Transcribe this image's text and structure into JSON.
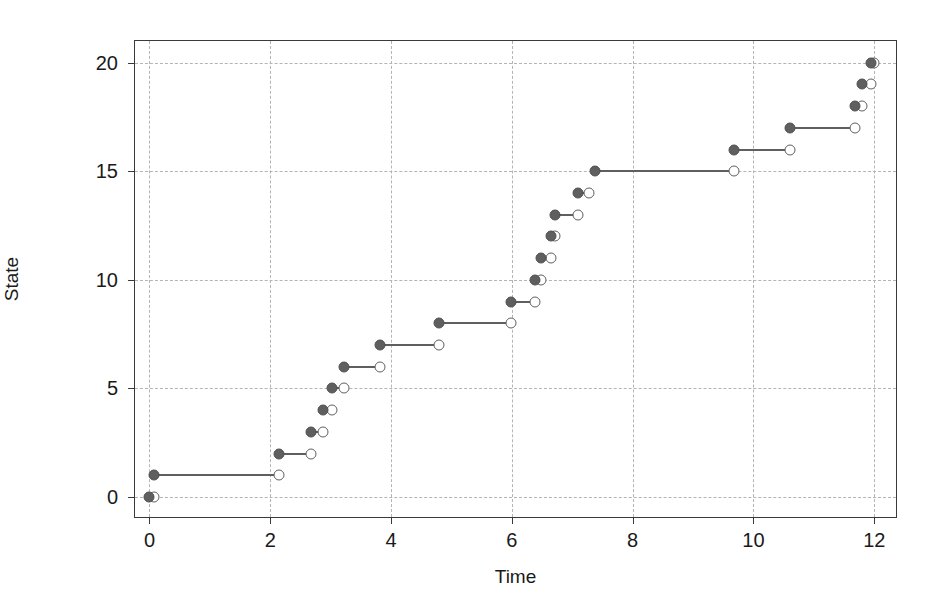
{
  "chart_data": {
    "type": "line",
    "title": "",
    "xlabel": "Time",
    "ylabel": "State",
    "xlim": [
      -0.24,
      12.36
    ],
    "ylim": [
      -0.92,
      21.0
    ],
    "grid": true,
    "legend": "none",
    "xticks": [
      0,
      2,
      4,
      6,
      8,
      10,
      12
    ],
    "yticks": [
      0,
      5,
      10,
      15,
      20
    ],
    "xticklabels": [
      "0",
      "2",
      "4",
      "6",
      "8",
      "10",
      "12"
    ],
    "yticklabels": [
      "0",
      "5",
      "10",
      "15",
      "20"
    ],
    "marker_styles": {
      "start_marker": "filled-circle",
      "end_marker": "open-circle",
      "line_color": "#5f5f5f",
      "fill_color": "#5f5f5f",
      "open_fill": "#ffffff"
    },
    "segments": [
      {
        "state": 0,
        "t_start": 0.0,
        "t_end": 0.08
      },
      {
        "state": 1,
        "t_start": 0.08,
        "t_end": 2.15
      },
      {
        "state": 2,
        "t_start": 2.15,
        "t_end": 2.68
      },
      {
        "state": 3,
        "t_start": 2.68,
        "t_end": 2.88
      },
      {
        "state": 4,
        "t_start": 2.88,
        "t_end": 3.03
      },
      {
        "state": 5,
        "t_start": 3.03,
        "t_end": 3.22
      },
      {
        "state": 6,
        "t_start": 3.22,
        "t_end": 3.82
      },
      {
        "state": 7,
        "t_start": 3.82,
        "t_end": 4.8
      },
      {
        "state": 8,
        "t_start": 4.8,
        "t_end": 5.98
      },
      {
        "state": 9,
        "t_start": 5.98,
        "t_end": 6.38
      },
      {
        "state": 10,
        "t_start": 6.38,
        "t_end": 6.48
      },
      {
        "state": 11,
        "t_start": 6.48,
        "t_end": 6.65
      },
      {
        "state": 12,
        "t_start": 6.65,
        "t_end": 6.72
      },
      {
        "state": 13,
        "t_start": 6.72,
        "t_end": 7.1
      },
      {
        "state": 14,
        "t_start": 7.1,
        "t_end": 7.28
      },
      {
        "state": 15,
        "t_start": 7.38,
        "t_end": 9.68
      },
      {
        "state": 16,
        "t_start": 9.68,
        "t_end": 10.6
      },
      {
        "state": 17,
        "t_start": 10.6,
        "t_end": 11.68
      },
      {
        "state": 18,
        "t_start": 11.68,
        "t_end": 11.8
      },
      {
        "state": 19,
        "t_start": 11.8,
        "t_end": 11.95
      },
      {
        "state": 20,
        "t_start": 11.95,
        "t_end": 11.99
      }
    ]
  },
  "style": {
    "grid_color": "#b4b4b4",
    "frame_color": "#3a3a3a",
    "background": "#ffffff",
    "text_color": "#1a1a1a"
  }
}
